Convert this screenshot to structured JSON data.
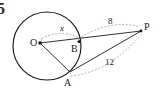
{
  "figure": {
    "number": "5",
    "type": "circle-tangent-secant-diagram",
    "background_color": "#ffffff",
    "stroke_color": "#1a1a1a",
    "dash_color": "#8a8a8a"
  },
  "points": {
    "center": {
      "name": "O",
      "x": 40,
      "y": 43
    },
    "secant_on_circle": {
      "name": "B",
      "x": 79,
      "y": 41
    },
    "tangent_point": {
      "name": "A",
      "x": 70,
      "y": 72
    },
    "external": {
      "name": "P",
      "x": 141,
      "y": 31
    }
  },
  "circle": {
    "center_x": 47,
    "center_y": 46,
    "radius": 34
  },
  "measurements": [
    {
      "label": "x",
      "italic": true,
      "from": "O",
      "to": "B",
      "kind": "radius"
    },
    {
      "label": "8",
      "italic": false,
      "from": "B",
      "to": "P",
      "kind": "external-secant"
    },
    {
      "label": "12",
      "italic": false,
      "from": "A",
      "to": "P",
      "kind": "tangent"
    }
  ],
  "segments": [
    {
      "name": "OP",
      "from": "O",
      "to": "P",
      "style": "solid"
    },
    {
      "name": "OA",
      "from": "O",
      "to": "A",
      "style": "solid"
    },
    {
      "name": "AP",
      "from": "A",
      "to": "P",
      "style": "solid"
    }
  ]
}
